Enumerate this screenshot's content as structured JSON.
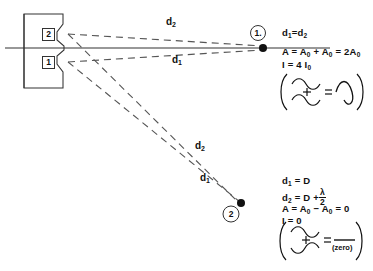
{
  "figure": {
    "barrier": {
      "slit_labels": [
        "2",
        "1"
      ]
    },
    "axis_label": "",
    "rays": {
      "upper_d2_label": "d",
      "upper_d2_sub": "2",
      "upper_d1_label": "d",
      "upper_d1_sub": "1",
      "lower_d2_label": "d",
      "lower_d2_sub": "2",
      "lower_d1_label": "d",
      "lower_d1_sub": "1"
    },
    "points": [
      {
        "name": "point-1",
        "label": "1."
      },
      {
        "name": "point-2",
        "label": "2"
      }
    ],
    "point1_equations": {
      "line1_pre": "d",
      "line1_sub1": "1",
      "line1_mid": "=d",
      "line1_sub2": "2",
      "line2_a": "A = A",
      "line2_sub1": "0",
      "line2_b": " + A",
      "line2_sub2": "0",
      "line2_c": " = 2A",
      "line2_sub3": "0",
      "line3_a": "I = 4 I",
      "line3_sub": "0"
    },
    "point2_equations": {
      "line1_pre": "d",
      "line1_sub": "1",
      "line1_post": " = D",
      "line2_pre": "d",
      "line2_sub": "2",
      "line2_post": " = D +",
      "line2_frac_num": "λ",
      "line2_frac_den": "2",
      "line3_a": "A = A",
      "line3_sub1": "0",
      "line3_b": " − A",
      "line3_sub2": "0",
      "line3_c": " = 0",
      "line4": "I = 0"
    },
    "wave_diagram_1": {
      "operator": "+",
      "equals": "=",
      "result_note": ""
    },
    "wave_diagram_2": {
      "operator": "+",
      "equals": "=",
      "result_note": "(zero)"
    },
    "colors": {
      "ink": "#111111",
      "line": "#333333",
      "dash": "#555555"
    }
  }
}
